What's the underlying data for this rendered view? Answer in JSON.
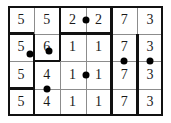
{
  "figure": {
    "rows": 4,
    "columns": 6,
    "cell_width": 25.8,
    "cell_height": 27.5,
    "ink_color": "#111111",
    "dot_color": "#000000",
    "grid_line_color": "#8c8c8c",
    "background": "#ffffff"
  },
  "grid": {
    "values": [
      [
        "5",
        "5",
        "2",
        "2",
        "7",
        "3"
      ],
      [
        "5",
        "6",
        "1",
        "1",
        "7",
        "3"
      ],
      [
        "5",
        "4",
        "1",
        "1",
        "7",
        "3"
      ],
      [
        "5",
        "4",
        "1",
        "1",
        "7",
        "3"
      ]
    ]
  },
  "dots": [
    {
      "id": "dot-r1-c3c4",
      "label": "dot on vertical edge between row 1 column 3 and column 4",
      "x": 77.5,
      "y": 13.8
    },
    {
      "id": "dot-r2-c1",
      "label": "dot at lower right of the 5 in row 2 column 1",
      "x": 22.0,
      "y": 48.0
    },
    {
      "id": "dot-r2-c2",
      "label": "dot at lower left of the 6 in row 2 column 2",
      "x": 40.5,
      "y": 45.0
    },
    {
      "id": "dot-r2r3-c5",
      "label": "dot on horizontal edge between row 2 and row 3 in column 5",
      "x": 116.3,
      "y": 55.0
    },
    {
      "id": "dot-r2r3-c6",
      "label": "dot on horizontal edge between row 2 and row 3 in column 6",
      "x": 142.1,
      "y": 55.0
    },
    {
      "id": "dot-r3-c3c4",
      "label": "dot on vertical edge between row 3 column 3 and column 4",
      "x": 77.5,
      "y": 68.8
    },
    {
      "id": "dot-r3r4-c2",
      "label": "dot on horizontal edge between row 3 and row 4 in column 2",
      "x": 38.7,
      "y": 82.5
    }
  ],
  "bold_segments": [
    {
      "id": "bold-v-c1c2-row2",
      "label": "bold vertical segment between column 1 and column 2 spanning row 2"
    },
    {
      "id": "bold-v-c1c2-row3",
      "label": "bold vertical segment between column 1 and column 2 spanning row 3"
    },
    {
      "id": "bold-v-c1c2-row4",
      "label": "bold vertical segment between column 1 and column 2 spanning row 4"
    },
    {
      "id": "bold-v-c2c3-row1",
      "label": "bold vertical segment between column 2 and column 3 spanning row 1"
    },
    {
      "id": "bold-v-c2c3-row2",
      "label": "bold vertical segment between column 2 and column 3 spanning row 2"
    },
    {
      "id": "bold-v-c4c5-row1",
      "label": "bold vertical segment between column 4 and column 5 spanning row 1"
    },
    {
      "id": "bold-v-c4c5-row2",
      "label": "bold vertical segment between column 4 and column 5 spanning row 2"
    },
    {
      "id": "bold-v-c4c5-row3",
      "label": "bold vertical segment between column 4 and column 5 spanning row 3"
    },
    {
      "id": "bold-v-c4c5-row4",
      "label": "bold vertical segment between column 4 and column 5 spanning row 4"
    },
    {
      "id": "bold-v-c5c6-row2",
      "label": "bold vertical segment between column 5 and column 6 spanning row 2"
    },
    {
      "id": "bold-v-c5c6-row3",
      "label": "bold vertical segment between column 5 and column 6 spanning row 3"
    },
    {
      "id": "bold-v-c5c6-row4",
      "label": "bold vertical segment between column 5 and column 6 spanning row 4"
    },
    {
      "id": "bold-h-r1r2-c1",
      "label": "bold horizontal segment between row 1 and row 2 in column 1"
    },
    {
      "id": "bold-h-r1r2-c3",
      "label": "bold horizontal segment between row 1 and row 2 in column 3"
    },
    {
      "id": "bold-h-r1r2-c4",
      "label": "bold horizontal segment between row 1 and row 2 in column 4"
    },
    {
      "id": "bold-h-r2r3-c2",
      "label": "bold horizontal segment between row 2 and row 3 in column 2"
    },
    {
      "id": "bold-h-r3r4-c1",
      "label": "bold horizontal segment between row 3 and row 4 in column 1"
    }
  ]
}
